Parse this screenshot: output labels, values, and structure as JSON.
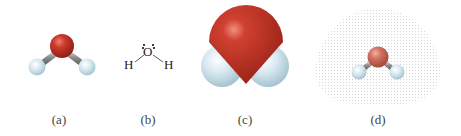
{
  "figure": {
    "panels": [
      {
        "id": "a",
        "label": "(a)",
        "type": "ball-and-stick model"
      },
      {
        "id": "b",
        "label": "(b)",
        "type": "Lewis structure",
        "atoms": {
          "center": "O",
          "left": "H",
          "right": "H"
        }
      },
      {
        "id": "c",
        "label": "(c)",
        "type": "space-filling model"
      },
      {
        "id": "d",
        "label": "(d)",
        "type": "electron density cloud model"
      }
    ],
    "colors": {
      "oxygen": "#c0392b",
      "oxygen_light": "#d07060",
      "hydrogen": "#cfe3ec",
      "bond": "#9a9a9a",
      "cloud_dots": "#d8d8d8"
    }
  }
}
